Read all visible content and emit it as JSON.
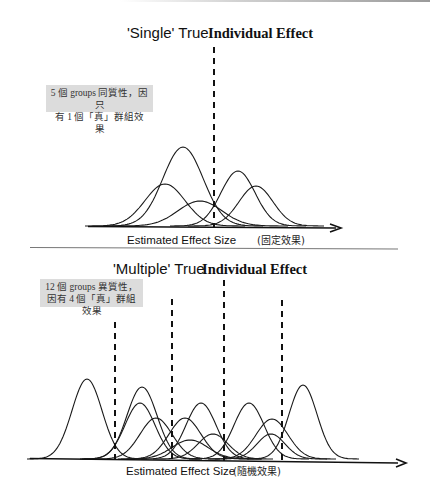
{
  "top_panel": {
    "title_quote": "'Single' True",
    "title_bold": "Individual Effect",
    "note_line1": "5 個 groups 同質性，因只",
    "note_line2": "有 1 個「真」群組效果",
    "axis_label": "Estimated Effect Size",
    "axis_label_suffix": "(固定效果)"
  },
  "bottom_panel": {
    "title_quote": "'Multiple' True",
    "title_bold": "Individual Effect",
    "note_line1": "12 個 groups 異質性，",
    "note_line2": "因有 4 個「真」群組效果",
    "axis_label": "Estimated Effect Size",
    "axis_label_suffix": "(隨機效果)"
  },
  "chart_data": [
    {
      "type": "line",
      "title": "'Single' True Individual Effect",
      "xlabel": "Estimated Effect Size (固定效果)",
      "ylabel": "",
      "grid": false,
      "description": "5 overlapping normal distribution curves around a single true effect (dashed vertical line)",
      "true_effects_x_px": [
        214
      ],
      "curves": [
        {
          "center_px": 183,
          "peak_px": 147,
          "sigma_px": 20
        },
        {
          "center_px": 165,
          "peak_px": 184,
          "sigma_px": 20
        },
        {
          "center_px": 200,
          "peak_px": 201,
          "sigma_px": 22
        },
        {
          "center_px": 238,
          "peak_px": 171,
          "sigma_px": 17
        },
        {
          "center_px": 256,
          "peak_px": 186,
          "sigma_px": 17
        }
      ],
      "baseline_px": 226,
      "axis_x_range_px": [
        90,
        340
      ]
    },
    {
      "type": "line",
      "title": "'Multiple' True Individual Effect",
      "xlabel": "Estimated Effect Size (隨機效果)",
      "ylabel": "",
      "grid": false,
      "description": "12 overlapping normal distribution curves with 4 true group effects (dashed vertical lines)",
      "true_effects_x_px": [
        115,
        172,
        224,
        282
      ],
      "true_effects_top_px": [
        322,
        299,
        280,
        300
      ],
      "curves": [
        {
          "center_px": 87,
          "peak_px": 379,
          "sigma_px": 15
        },
        {
          "center_px": 142,
          "peak_px": 387,
          "sigma_px": 15
        },
        {
          "center_px": 140,
          "peak_px": 403,
          "sigma_px": 15
        },
        {
          "center_px": 156,
          "peak_px": 418,
          "sigma_px": 16
        },
        {
          "center_px": 185,
          "peak_px": 418,
          "sigma_px": 16
        },
        {
          "center_px": 201,
          "peak_px": 403,
          "sigma_px": 15
        },
        {
          "center_px": 213,
          "peak_px": 434,
          "sigma_px": 15
        },
        {
          "center_px": 249,
          "peak_px": 403,
          "sigma_px": 15
        },
        {
          "center_px": 272,
          "peak_px": 419,
          "sigma_px": 16
        },
        {
          "center_px": 271,
          "peak_px": 434,
          "sigma_px": 14
        },
        {
          "center_px": 303,
          "peak_px": 385,
          "sigma_px": 14
        },
        {
          "center_px": 190,
          "peak_px": 440,
          "sigma_px": 18
        }
      ],
      "baseline_px": 459,
      "axis_x_range_px": [
        30,
        404
      ]
    }
  ]
}
